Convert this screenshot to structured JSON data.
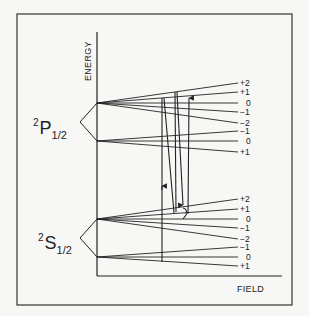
{
  "diagram": {
    "type": "zeeman-energy-level-diagram",
    "axes": {
      "y_label": "ENERGY",
      "x_label": "FIELD"
    },
    "states": [
      {
        "id": "P",
        "sup": "2",
        "letter": "P",
        "sub": "1/2",
        "sublevels": [
          {
            "label": "+2"
          },
          {
            "label": "+1"
          },
          {
            "label": "0"
          },
          {
            "label": "−1"
          },
          {
            "label": "−2"
          },
          {
            "label": "−1"
          },
          {
            "label": "0"
          },
          {
            "label": "+1"
          }
        ]
      },
      {
        "id": "S",
        "sup": "2",
        "letter": "S",
        "sub": "1/2",
        "sublevels": [
          {
            "label": "+2"
          },
          {
            "label": "+1"
          },
          {
            "label": "0"
          },
          {
            "label": "−1"
          },
          {
            "label": "−2"
          },
          {
            "label": "−1"
          },
          {
            "label": "0"
          },
          {
            "label": "+1"
          }
        ]
      }
    ],
    "colors": {
      "ink": "#222222",
      "background": "#f7f7f5"
    }
  }
}
